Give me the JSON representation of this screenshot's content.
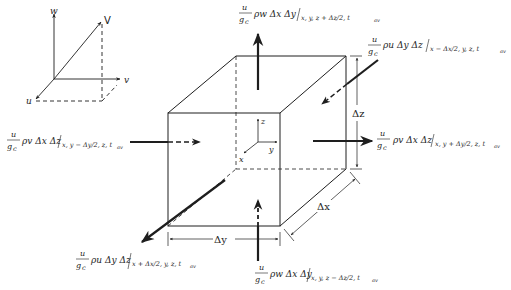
{
  "diagram": {
    "type": "control-volume-momentum-flux",
    "line_color": "#1e1e1e",
    "background": "#ffffff"
  },
  "velocity_triad": {
    "vector_label": "V",
    "axes": {
      "w": "w",
      "v": "v",
      "u": "u"
    }
  },
  "cube_axes": {
    "z": "z",
    "y": "y",
    "x": "x"
  },
  "dimensions": {
    "dz": "Δz",
    "dy": "Δy",
    "dx": "Δx"
  },
  "fluxes": {
    "top": {
      "numer": "u",
      "denom": "g",
      "denom_sub": "c",
      "body": "ρw Δx Δy",
      "eval": "x, y, z + Δz/2, t",
      "eval_sub": "av"
    },
    "back": {
      "numer": "u",
      "denom": "g",
      "denom_sub": "c",
      "body": "ρu Δy Δz",
      "eval": "x − Δx/2, y, z, t",
      "eval_sub": "av"
    },
    "left": {
      "numer": "u",
      "denom": "g",
      "denom_sub": "c",
      "body": "ρv Δx Δz",
      "eval": "x, y − Δy/2, z, t",
      "eval_sub": "av"
    },
    "right": {
      "numer": "u",
      "denom": "g",
      "denom_sub": "c",
      "body": "ρv Δx Δz",
      "eval": "x, y + Δy/2, z, t",
      "eval_sub": "av"
    },
    "front": {
      "numer": "u",
      "denom": "g",
      "denom_sub": "c",
      "body": "ρu Δy Δz",
      "eval": "x + Δx/2, y, z, t",
      "eval_sub": "av"
    },
    "bottom": {
      "numer": "u",
      "denom": "g",
      "denom_sub": "c",
      "body": "ρw Δx Δy",
      "eval": "x, y, z − Δz/2, t",
      "eval_sub": "av"
    }
  }
}
